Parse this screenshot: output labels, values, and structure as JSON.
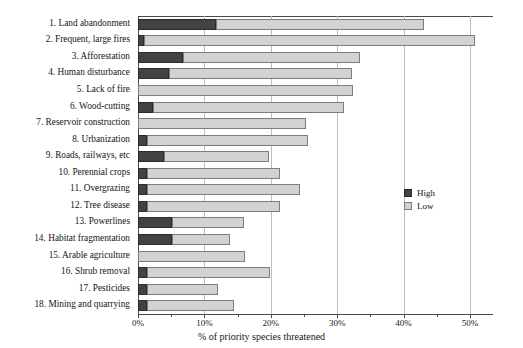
{
  "chart_data": {
    "type": "bar",
    "orientation": "horizontal",
    "stacked": true,
    "title": "",
    "xlabel": "% of priority species threatened",
    "ylabel": "",
    "xlim": [
      0,
      50
    ],
    "xticks": [
      "0%",
      "10%",
      "20%",
      "30%",
      "40%",
      "50%"
    ],
    "xtick_values": [
      0,
      10,
      20,
      30,
      40,
      50
    ],
    "grid": "vertical",
    "legend_position": "right-middle",
    "categories": [
      "1. Land abandonment",
      "2. Frequent, large fires",
      "3. Afforestation",
      "4. Human disturbance",
      "5. Lack of fire",
      "6. Wood-cutting",
      "7. Reservoir construction",
      "8. Urbanization",
      "9. Roads, railways, etc",
      "10. Perennial crops",
      "11. Overgrazing",
      "12. Tree disease",
      "13. Powerlines",
      "14. Habitat fragmentation",
      "15. Arable agriculture",
      "16. Shrub removal",
      "17. Pesticides",
      "18. Mining and quarrying"
    ],
    "series": [
      {
        "name": "High",
        "color": "#434343",
        "values": [
          11.8,
          0.9,
          6.8,
          4.6,
          0.0,
          2.2,
          0.0,
          1.4,
          3.9,
          1.4,
          1.4,
          1.4,
          5.1,
          5.1,
          0.0,
          1.4,
          1.4,
          1.4
        ]
      },
      {
        "name": "Low",
        "color": "#d2d2d2",
        "values": [
          31.2,
          49.9,
          26.7,
          27.6,
          32.4,
          28.8,
          25.3,
          24.2,
          15.8,
          20.0,
          23.0,
          20.0,
          10.9,
          8.7,
          16.1,
          18.5,
          10.6,
          13.0
        ]
      }
    ],
    "totals": [
      43.0,
      50.8,
      33.5,
      32.2,
      32.4,
      31.0,
      25.3,
      25.6,
      19.7,
      21.4,
      24.4,
      21.4,
      16.0,
      13.8,
      16.1,
      19.9,
      12.0,
      14.4
    ]
  },
  "legend": {
    "items": [
      {
        "label": "High",
        "color": "#434343"
      },
      {
        "label": "Low",
        "color": "#d2d2d2"
      }
    ]
  },
  "axis": {
    "x_title": "% of priority species threatened"
  }
}
